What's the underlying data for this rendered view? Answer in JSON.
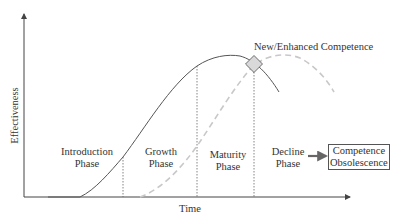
{
  "diagram": {
    "axes": {
      "x_label": "Time",
      "y_label": "Effectiveness"
    },
    "phases": [
      {
        "line1": "Introduction",
        "line2": "Phase"
      },
      {
        "line1": "Growth",
        "line2": "Phase"
      },
      {
        "line1": "Maturity",
        "line2": "Phase"
      },
      {
        "line1": "Decline",
        "line2": "Phase"
      }
    ],
    "marker_label": "New/Enhanced Competence",
    "outcome_box": {
      "line1": "Competence",
      "line2": "Obsolescence"
    },
    "curves": [
      {
        "name": "current-competence",
        "style": "solid",
        "color": "#555555"
      },
      {
        "name": "new-competence",
        "style": "dashed",
        "color": "#c8c8c8"
      }
    ],
    "marker_color": "#d9d9d9",
    "arrow_color": "#666666"
  }
}
